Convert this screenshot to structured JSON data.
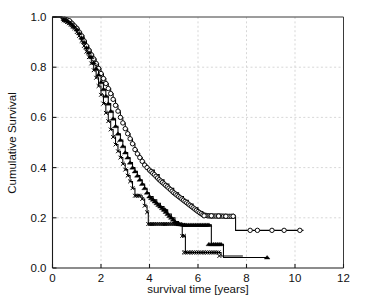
{
  "chart_data": {
    "type": "line",
    "title": "",
    "subtitle": "",
    "xlabel": "survival time [years]",
    "ylabel": "Cumulative Survival",
    "xlim": [
      0,
      12
    ],
    "ylim": [
      0.0,
      1.0
    ],
    "xticks": [
      0,
      2,
      4,
      6,
      8,
      10,
      12
    ],
    "xtick_labels": [
      "0",
      "2",
      "4",
      "6",
      "8",
      "10",
      "12"
    ],
    "yticks": [
      0.0,
      0.2,
      0.4,
      0.6,
      0.8,
      1.0
    ],
    "ytick_labels": [
      "0.0",
      "0.2",
      "0.4",
      "0.6",
      "0.8",
      "1.0"
    ],
    "grid": true,
    "grid_style": "dotted",
    "grid_color": "#d2d2d2",
    "legend": "none",
    "legend_position": "none",
    "curve_style": "kaplan-meier-step",
    "series": [
      {
        "name": "group-circle",
        "marker": "open-circle",
        "color": "#000000",
        "points": [
          [
            0.0,
            1.0
          ],
          [
            0.35,
            0.995
          ],
          [
            0.55,
            0.99
          ],
          [
            0.7,
            0.985
          ],
          [
            0.8,
            0.975
          ],
          [
            0.9,
            0.965
          ],
          [
            1.0,
            0.955
          ],
          [
            1.1,
            0.94
          ],
          [
            1.2,
            0.925
          ],
          [
            1.3,
            0.905
          ],
          [
            1.4,
            0.885
          ],
          [
            1.5,
            0.868
          ],
          [
            1.6,
            0.85
          ],
          [
            1.7,
            0.833
          ],
          [
            1.8,
            0.815
          ],
          [
            1.9,
            0.795
          ],
          [
            2.0,
            0.775
          ],
          [
            2.1,
            0.755
          ],
          [
            2.2,
            0.735
          ],
          [
            2.3,
            0.715
          ],
          [
            2.4,
            0.695
          ],
          [
            2.5,
            0.672
          ],
          [
            2.6,
            0.648
          ],
          [
            2.7,
            0.625
          ],
          [
            2.8,
            0.6
          ],
          [
            2.9,
            0.578
          ],
          [
            3.0,
            0.555
          ],
          [
            3.1,
            0.535
          ],
          [
            3.2,
            0.515
          ],
          [
            3.3,
            0.495
          ],
          [
            3.4,
            0.472
          ],
          [
            3.5,
            0.455
          ],
          [
            3.6,
            0.44
          ],
          [
            3.7,
            0.425
          ],
          [
            3.8,
            0.41
          ],
          [
            3.9,
            0.4
          ],
          [
            4.0,
            0.39
          ],
          [
            4.2,
            0.372
          ],
          [
            4.4,
            0.352
          ],
          [
            4.6,
            0.335
          ],
          [
            4.8,
            0.318
          ],
          [
            5.0,
            0.3
          ],
          [
            5.2,
            0.285
          ],
          [
            5.4,
            0.27
          ],
          [
            5.6,
            0.255
          ],
          [
            5.8,
            0.24
          ],
          [
            6.0,
            0.225
          ],
          [
            6.2,
            0.212
          ],
          [
            6.4,
            0.208
          ],
          [
            6.6,
            0.207
          ],
          [
            6.9,
            0.207
          ],
          [
            7.2,
            0.206
          ],
          [
            7.45,
            0.206
          ],
          [
            7.55,
            0.15
          ],
          [
            10.35,
            0.15
          ]
        ],
        "censor_points": [
          [
            6.25,
            0.208
          ],
          [
            6.55,
            0.208
          ],
          [
            6.85,
            0.207
          ],
          [
            7.15,
            0.206
          ],
          [
            7.45,
            0.206
          ],
          [
            8.15,
            0.15
          ],
          [
            8.45,
            0.15
          ],
          [
            9.05,
            0.15
          ],
          [
            9.55,
            0.15
          ],
          [
            10.2,
            0.15
          ]
        ],
        "final_survival": 0.15
      },
      {
        "name": "group-triangle",
        "marker": "filled-triangle",
        "color": "#000000",
        "points": [
          [
            0.0,
            1.0
          ],
          [
            0.4,
            0.995
          ],
          [
            0.6,
            0.985
          ],
          [
            0.75,
            0.975
          ],
          [
            0.9,
            0.96
          ],
          [
            1.0,
            0.95
          ],
          [
            1.1,
            0.935
          ],
          [
            1.2,
            0.918
          ],
          [
            1.3,
            0.9
          ],
          [
            1.4,
            0.878
          ],
          [
            1.5,
            0.858
          ],
          [
            1.6,
            0.84
          ],
          [
            1.7,
            0.818
          ],
          [
            1.8,
            0.795
          ],
          [
            1.9,
            0.77
          ],
          [
            2.0,
            0.74
          ],
          [
            2.1,
            0.712
          ],
          [
            2.2,
            0.685
          ],
          [
            2.3,
            0.655
          ],
          [
            2.4,
            0.625
          ],
          [
            2.5,
            0.595
          ],
          [
            2.6,
            0.565
          ],
          [
            2.7,
            0.535
          ],
          [
            2.8,
            0.51
          ],
          [
            2.9,
            0.485
          ],
          [
            3.0,
            0.46
          ],
          [
            3.1,
            0.44
          ],
          [
            3.2,
            0.42
          ],
          [
            3.3,
            0.4
          ],
          [
            3.4,
            0.385
          ],
          [
            3.5,
            0.368
          ],
          [
            3.6,
            0.352
          ],
          [
            3.7,
            0.335
          ],
          [
            3.8,
            0.318
          ],
          [
            3.9,
            0.3
          ],
          [
            4.0,
            0.285
          ],
          [
            4.15,
            0.272
          ],
          [
            4.3,
            0.258
          ],
          [
            4.45,
            0.245
          ],
          [
            4.6,
            0.232
          ],
          [
            4.75,
            0.215
          ],
          [
            4.9,
            0.2
          ],
          [
            5.05,
            0.185
          ],
          [
            5.2,
            0.175
          ],
          [
            5.45,
            0.172
          ],
          [
            5.9,
            0.172
          ],
          [
            6.25,
            0.172
          ],
          [
            6.45,
            0.172
          ],
          [
            6.55,
            0.095
          ],
          [
            6.95,
            0.095
          ],
          [
            7.05,
            0.042
          ],
          [
            8.9,
            0.042
          ]
        ],
        "censor_points": [
          [
            4.65,
            0.232
          ],
          [
            5.45,
            0.172
          ],
          [
            6.45,
            0.095
          ],
          [
            8.85,
            0.042
          ]
        ],
        "final_survival": 0.042
      },
      {
        "name": "group-x",
        "marker": "x-cross",
        "color": "#000000",
        "points": [
          [
            0.0,
            1.0
          ],
          [
            0.4,
            0.99
          ],
          [
            0.6,
            0.98
          ],
          [
            0.75,
            0.97
          ],
          [
            0.9,
            0.955
          ],
          [
            1.0,
            0.94
          ],
          [
            1.1,
            0.925
          ],
          [
            1.2,
            0.905
          ],
          [
            1.3,
            0.885
          ],
          [
            1.4,
            0.862
          ],
          [
            1.5,
            0.84
          ],
          [
            1.6,
            0.815
          ],
          [
            1.7,
            0.788
          ],
          [
            1.8,
            0.758
          ],
          [
            1.9,
            0.725
          ],
          [
            2.0,
            0.69
          ],
          [
            2.1,
            0.655
          ],
          [
            2.2,
            0.618
          ],
          [
            2.3,
            0.585
          ],
          [
            2.4,
            0.552
          ],
          [
            2.5,
            0.522
          ],
          [
            2.6,
            0.492
          ],
          [
            2.7,
            0.465
          ],
          [
            2.8,
            0.44
          ],
          [
            2.9,
            0.415
          ],
          [
            3.0,
            0.392
          ],
          [
            3.1,
            0.368
          ],
          [
            3.2,
            0.345
          ],
          [
            3.3,
            0.318
          ],
          [
            3.4,
            0.288
          ],
          [
            3.6,
            0.288
          ],
          [
            3.7,
            0.275
          ],
          [
            3.8,
            0.248
          ],
          [
            3.9,
            0.222
          ],
          [
            3.95,
            0.175
          ],
          [
            5.25,
            0.175
          ],
          [
            5.35,
            0.128
          ],
          [
            5.42,
            0.128
          ],
          [
            5.48,
            0.062
          ],
          [
            6.85,
            0.062
          ],
          [
            6.95,
            0.048
          ],
          [
            7.85,
            0.048
          ]
        ],
        "censor_points": [
          [
            5.42,
            0.062
          ],
          [
            6.88,
            0.048
          ]
        ],
        "final_survival": 0.048
      }
    ]
  },
  "axes": {
    "x_title": "survival time [years]",
    "y_title": "Cumulative Survival"
  }
}
